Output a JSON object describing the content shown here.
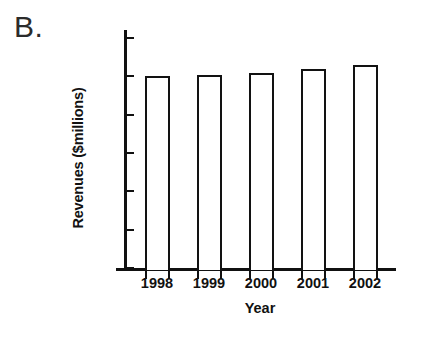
{
  "figure": {
    "panel_label": "B.",
    "background_color": "#ffffff",
    "ink_color": "#111111"
  },
  "chart_data": {
    "type": "bar",
    "title": "",
    "panel": "B.",
    "categories": [
      "1998",
      "1999",
      "2000",
      "2001",
      "2002"
    ],
    "values": [
      50,
      50.3,
      51,
      52,
      53
    ],
    "xlabel": "Year",
    "ylabel": "Revenues ($millions)",
    "ylim": [
      0,
      60
    ],
    "ytick_values": [
      0,
      10,
      20,
      30,
      40,
      50,
      60
    ],
    "ytick_labels": [
      "0",
      "10",
      "20",
      "30",
      "40",
      "50",
      "60"
    ],
    "ytick_direction": "in",
    "xtick_direction": "out",
    "xtick_position": "bar-edges",
    "grid": false,
    "legend": null,
    "bar_fill": "none",
    "bar_edge_color": "#121212",
    "series": [
      {
        "name": "Revenues",
        "values": [
          50,
          50.3,
          51,
          52,
          53
        ]
      }
    ]
  }
}
